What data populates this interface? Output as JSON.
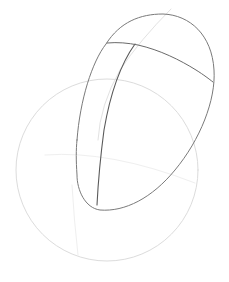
{
  "drawing": {
    "subject": "pencil sketch of a computer mouse over a circle construction guide",
    "background": "#ffffff",
    "stroke_colors": {
      "dark": "#555555",
      "medium": "#8a8a8a",
      "light": "#d6d6d6",
      "faint": "#ececec"
    },
    "circle": {
      "cx": 107,
      "cy": 170,
      "r": 91
    }
  }
}
